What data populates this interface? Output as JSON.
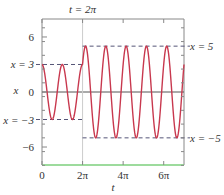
{
  "chart_data": {
    "type": "line",
    "title": "",
    "top_annotation": "t = 2π",
    "xlabel": "t",
    "ylabel": "x",
    "xlim_pi": [
      0,
      7
    ],
    "ylim": [
      -8,
      8
    ],
    "x_ticks": [
      {
        "value_pi": 0,
        "label": "0"
      },
      {
        "value_pi": 2,
        "label": "2π"
      },
      {
        "value_pi": 4,
        "label": "4π"
      },
      {
        "value_pi": 6,
        "label": "6π"
      }
    ],
    "y_ticks": [
      {
        "value": 6,
        "label": "6"
      },
      {
        "value": 0,
        "label": "0"
      },
      {
        "value": -6,
        "label": "−6"
      }
    ],
    "series": [
      {
        "name": "x(t)",
        "color": "#c8384e",
        "segments": [
          {
            "t_range_pi": [
              0,
              2
            ],
            "formula": "x = 3 cos(2t)",
            "amplitude": 3
          },
          {
            "t_range_pi": [
              2,
              7
            ],
            "formula": "x = 5 cos(2(t − 2π) − φ), cos φ = 3/5",
            "amplitude": 5
          }
        ]
      }
    ],
    "reference_lines": [
      {
        "label": "x = 3",
        "value": 3,
        "t_range_pi": [
          0,
          2
        ],
        "style": "dashed",
        "side": "left"
      },
      {
        "label": "x = −3",
        "value": -3,
        "t_range_pi": [
          0,
          2
        ],
        "style": "dashed",
        "side": "left"
      },
      {
        "label": "x = 5",
        "value": 5,
        "t_range_pi": [
          2,
          7
        ],
        "style": "dashed",
        "side": "right"
      },
      {
        "label": "x = −5",
        "value": -5,
        "t_range_pi": [
          2,
          7
        ],
        "style": "dashed",
        "side": "right"
      }
    ],
    "vertical_marker": {
      "t_pi": 2,
      "label": "t = 2π"
    },
    "colors": {
      "curve": "#c8384e",
      "axis_bottom": "#7ccf7c",
      "frame": "#888888",
      "zero_line": "#555555",
      "dashed": "#555577"
    },
    "grid": false
  }
}
